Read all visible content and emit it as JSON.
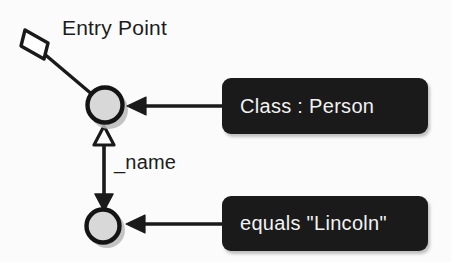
{
  "diagram": {
    "title_label": "Entry Point",
    "edge_label": "_name",
    "nodes": [
      {
        "id": "person-node",
        "label": "",
        "role": "entry-object-node"
      },
      {
        "id": "name-node",
        "label": "",
        "role": "attribute-object-node"
      }
    ],
    "callouts": [
      {
        "id": "class-callout",
        "text": "Class : Person"
      },
      {
        "id": "equals-callout",
        "text": "equals \"Lincoln\""
      }
    ],
    "colors": {
      "background": "#fbfbfb",
      "stroke": "#1a1a1a",
      "node_fill": "#d8d8d8",
      "callout_background": "#1a1a1a",
      "callout_text": "#f2f2f2",
      "label_text": "#1c1c1c"
    }
  }
}
